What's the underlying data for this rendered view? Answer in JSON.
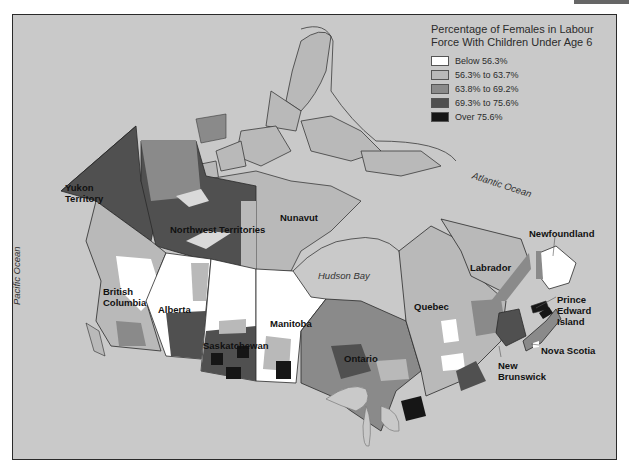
{
  "legend": {
    "title": "Percentage of Females in Labour Force With Children Under Age 6",
    "title_line1": "Percentage of Females in Labour",
    "title_line2": "Force With Children Under Age 6",
    "items": [
      {
        "label": "Below 56.3%",
        "color": "#ffffff"
      },
      {
        "label": "56.3% to 63.7%",
        "color": "#b9b9b9"
      },
      {
        "label": "63.8% to 69.2%",
        "color": "#8a8a8a"
      },
      {
        "label": "69.3% to 75.6%",
        "color": "#505050"
      },
      {
        "label": "Over 75.6%",
        "color": "#161616"
      }
    ]
  },
  "regions": {
    "yukon": "Yukon\nTerritory",
    "yukon_l1": "Yukon",
    "yukon_l2": "Territory",
    "nwt": "Northwest Territories",
    "nunavut": "Nunavut",
    "bc_l1": "British",
    "bc_l2": "Columbia",
    "alberta": "Alberta",
    "saskatchewan": "Saskatchewan",
    "manitoba": "Manitoba",
    "ontario": "Ontario",
    "quebec": "Quebec",
    "labrador": "Labrador",
    "newfoundland": "Newfoundland",
    "pei_l1": "Prince",
    "pei_l2": "Edward",
    "pei_l3": "Island",
    "nova_scotia": "Nova Scotia",
    "nb_l1": "New",
    "nb_l2": "Brunswick"
  },
  "water": {
    "pacific": "Pacific Ocean",
    "atlantic": "Atlantic Ocean",
    "hudson": "Hudson Bay"
  },
  "colors": {
    "background": "#c9c9c9",
    "frame_border": "#2a2a2a",
    "class1": "#ffffff",
    "class2": "#b9b9b9",
    "class3": "#8a8a8a",
    "class4": "#505050",
    "class5": "#161616"
  }
}
